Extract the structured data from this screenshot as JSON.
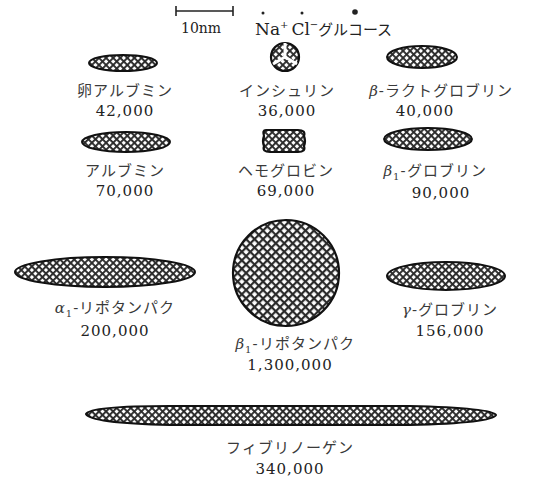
{
  "scale_bar": {
    "label": "10nm"
  },
  "reference": {
    "text": "Na⁺Cl⁻グルコース",
    "na": "Na",
    "na_sup": "+",
    "cl": "Cl",
    "cl_sup": "−",
    "glucose": "グルコース"
  },
  "colors": {
    "hatch": "#222222",
    "outline": "#111111",
    "text": "#333333"
  },
  "proteins": [
    {
      "id": "egg-albumin",
      "name": "卵アルブミン",
      "mw": "42,000",
      "shape": "ellipse"
    },
    {
      "id": "insulin",
      "name": "インシュリン",
      "mw": "36,000",
      "shape": "circle-trisected"
    },
    {
      "id": "beta-lactoglobulin",
      "prefix": "β",
      "sub": "",
      "name": "-ラクトグロブリン",
      "mw": "40,000",
      "shape": "ellipse"
    },
    {
      "id": "albumin",
      "name": "アルブミン",
      "mw": "70,000",
      "shape": "ellipse"
    },
    {
      "id": "hemoglobin",
      "name": "ヘモグロビン",
      "mw": "69,000",
      "shape": "rounded-rect"
    },
    {
      "id": "beta1-globulin",
      "prefix": "β",
      "sub": "1",
      "name": "-グロブリン",
      "mw": "90,000",
      "shape": "ellipse"
    },
    {
      "id": "alpha1-lipoprotein",
      "prefix": "α",
      "sub": "1",
      "name": "-リポタンパク",
      "mw": "200,000",
      "shape": "ellipse"
    },
    {
      "id": "beta1-lipoprotein",
      "prefix": "β",
      "sub": "1",
      "name": "-リポタンパク",
      "mw": "1,300,000",
      "shape": "circle"
    },
    {
      "id": "gamma-globulin",
      "prefix": "γ",
      "sub": "",
      "name": "-グロブリン",
      "mw": "156,000",
      "shape": "ellipse"
    },
    {
      "id": "fibrinogen",
      "name": "フィブリノーゲン",
      "mw": "340,000",
      "shape": "ellipse"
    }
  ]
}
